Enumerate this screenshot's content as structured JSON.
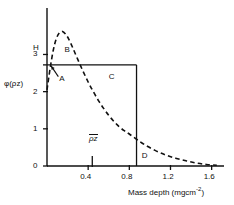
{
  "chart_data": {
    "type": "line",
    "title": "",
    "xlabel": "Mass depth (mgcm-2)",
    "xlabel_main": "Mass depth (mgcm",
    "xlabel_exp": "-2",
    "xlabel_close": ")",
    "ylabel": "φ(ρz)",
    "xlim": [
      0,
      1.72
    ],
    "ylim": [
      0,
      4.25
    ],
    "xticks": [
      0.4,
      0.8,
      1.2,
      1.6
    ],
    "xtick_labels": [
      "0.4",
      "0.8",
      "1.2",
      "1.6"
    ],
    "yticks": [
      0,
      1,
      2,
      3
    ],
    "ytick_labels": [
      "0",
      "1",
      "2",
      "3"
    ],
    "grid": false,
    "legend": "none",
    "series": [
      {
        "name": "phi-rho-z curve",
        "style": "dashed",
        "color": "#111111",
        "x": [
          0.0,
          0.03,
          0.06,
          0.09,
          0.12,
          0.15,
          0.18,
          0.21,
          0.25,
          0.3,
          0.35,
          0.4,
          0.45,
          0.5,
          0.55,
          0.6,
          0.65,
          0.7,
          0.75,
          0.8,
          0.87,
          0.95,
          1.05,
          1.15,
          1.25,
          1.35,
          1.45,
          1.55,
          1.65
        ],
        "y": [
          2.05,
          2.62,
          3.1,
          3.42,
          3.58,
          3.62,
          3.55,
          3.42,
          3.18,
          2.86,
          2.55,
          2.26,
          2.0,
          1.76,
          1.55,
          1.36,
          1.2,
          1.06,
          0.95,
          0.86,
          0.72,
          0.57,
          0.42,
          0.3,
          0.21,
          0.14,
          0.08,
          0.04,
          0.02
        ]
      }
    ],
    "rectangle": {
      "name": "equivalent-area-rectangle",
      "x0": 0.0,
      "x1": 0.87,
      "y0": 0.0,
      "y1": 2.72,
      "height_label": "H",
      "color": "#111111"
    },
    "markers": [
      {
        "name": "mean-mass-depth",
        "label": "ρz",
        "overline": true,
        "x": 0.44,
        "y": 0
      }
    ],
    "annotations": [
      {
        "name": "annotation-a",
        "label": "A",
        "x": 0.12,
        "y": 2.35,
        "arrow": true,
        "arrow_to_x": 0.02,
        "arrow_to_y": 2.72
      },
      {
        "name": "annotation-b",
        "label": "B",
        "x": 0.17,
        "y": 3.12,
        "arrow": false
      },
      {
        "name": "annotation-c",
        "label": "C",
        "x": 0.6,
        "y": 2.4,
        "arrow": false
      },
      {
        "name": "annotation-d",
        "label": "D",
        "x": 0.92,
        "y": 0.26,
        "arrow": false
      }
    ],
    "axis_height_label": "H"
  },
  "figure": {
    "ylabel": "φ(ρz)",
    "h_label": "H",
    "rho_z_label": "ρz"
  }
}
